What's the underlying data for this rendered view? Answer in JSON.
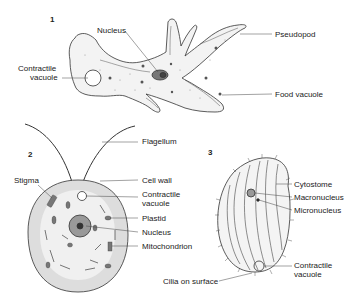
{
  "figures": [
    {
      "number": "1",
      "organism": "amoeba",
      "labels": {
        "nucleus": "Nucleus",
        "pseudopod": "Pseudopod",
        "contractile_vacuole_1": "Contractile",
        "contractile_vacuole_2": "vacuole",
        "food_vacuole": "Food vacuole"
      }
    },
    {
      "number": "2",
      "organism": "flagellate",
      "labels": {
        "flagellum": "Flagellum",
        "stigma": "Stigma",
        "cell_wall": "Cell wall",
        "contractile_vacuole_1": "Contractile",
        "contractile_vacuole_2": "vacuole",
        "plastid": "Plastid",
        "nucleus": "Nucleus",
        "mitochondrion": "Mitochondrion"
      }
    },
    {
      "number": "3",
      "organism": "ciliate",
      "labels": {
        "cytostome": "Cytostome",
        "macronucleus": "Macronucleus",
        "micronucleus": "Micronucleus",
        "contractile_vacuole_1": "Contractile",
        "contractile_vacuole_2": "vacuole",
        "cilia": "Cilia on surface"
      }
    }
  ]
}
